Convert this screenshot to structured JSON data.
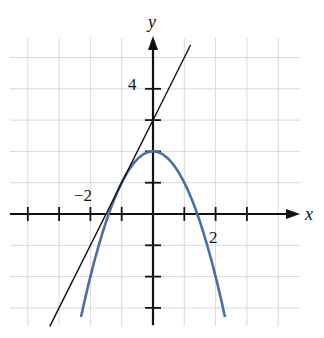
{
  "chart_data": {
    "type": "line",
    "title": "",
    "xlabel": "x",
    "ylabel": "y",
    "xlim": [
      -4.5,
      4.8
    ],
    "ylim": [
      -3.6,
      5.5
    ],
    "grid": true,
    "tick_labels": {
      "x": [
        {
          "value": -2,
          "text": "−2"
        },
        {
          "value": 2,
          "text": "2"
        }
      ],
      "y": [
        {
          "value": 4,
          "text": "4"
        }
      ]
    },
    "series": [
      {
        "name": "parabola",
        "equation": "y = 2 - x^2",
        "color": "#4a6fa5",
        "x": [
          -2.3,
          -2,
          -1.5,
          -1,
          -0.5,
          0,
          0.5,
          1,
          1.5,
          2,
          2.3
        ],
        "y": [
          -3.29,
          -2,
          -0.25,
          1,
          1.75,
          2,
          1.75,
          1,
          -0.25,
          -2,
          -3.29
        ]
      },
      {
        "name": "tangent line",
        "equation": "y = 2x + 3",
        "color": "#111111",
        "x": [
          -3.3,
          1.2
        ],
        "y": [
          -3.6,
          5.4
        ]
      }
    ]
  },
  "labels": {
    "x_axis": "x",
    "y_axis": "y",
    "x_neg2": "−2",
    "x_2": "2",
    "y_4": "4"
  }
}
